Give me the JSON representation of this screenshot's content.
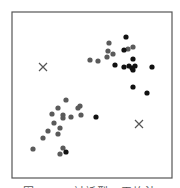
{
  "chart_data": {
    "type": "scatter",
    "title": "",
    "xlabel": "",
    "ylabel": "",
    "grid": false,
    "legend": "none",
    "frame": {
      "x": 12,
      "y": 12,
      "width": 160,
      "height": 166
    },
    "series": [
      {
        "name": "cluster-grey",
        "marker": "circle",
        "color": "#5a5a5a",
        "points": [
          [
            109,
            43
          ],
          [
            108,
            51
          ],
          [
            113,
            54
          ],
          [
            107,
            57
          ],
          [
            90,
            60
          ],
          [
            98,
            61
          ],
          [
            128,
            49
          ],
          [
            133,
            47
          ],
          [
            66,
            100
          ],
          [
            58,
            108
          ],
          [
            80,
            106
          ],
          [
            78,
            108
          ],
          [
            52,
            114
          ],
          [
            63,
            115
          ],
          [
            63,
            118
          ],
          [
            71,
            117
          ],
          [
            81,
            115
          ],
          [
            54,
            123
          ],
          [
            60,
            128
          ],
          [
            48,
            131
          ],
          [
            58,
            134
          ],
          [
            43,
            138
          ],
          [
            33,
            149
          ],
          [
            63,
            148
          ],
          [
            60,
            154
          ]
        ]
      },
      {
        "name": "cluster-black",
        "marker": "circle",
        "color": "#111111",
        "points": [
          [
            126,
            37
          ],
          [
            124,
            50
          ],
          [
            133,
            59
          ],
          [
            115,
            65
          ],
          [
            124,
            67
          ],
          [
            129,
            66
          ],
          [
            132,
            68
          ],
          [
            135,
            66
          ],
          [
            133,
            70
          ],
          [
            152,
            67
          ],
          [
            133,
            87
          ],
          [
            147,
            93
          ],
          [
            96,
            117
          ],
          [
            66,
            152
          ]
        ]
      },
      {
        "name": "centroids",
        "marker": "x",
        "color": "#555555",
        "points": [
          [
            43,
            67
          ],
          [
            139,
            124
          ]
        ]
      }
    ]
  },
  "caption": "図 13.3 対話型K-平均法"
}
